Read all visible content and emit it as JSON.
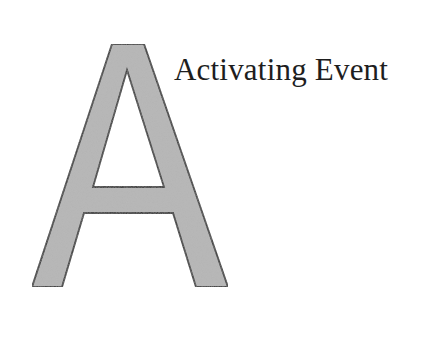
{
  "diagram": {
    "big_letter": "A",
    "label": "Activating Event",
    "colors": {
      "letter_fill": "#b4b4b4",
      "letter_stroke": "#1a1a1a",
      "text": "#1e1e1e",
      "background": "#ffffff"
    }
  }
}
